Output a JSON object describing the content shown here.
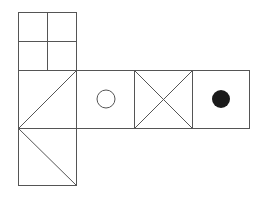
{
  "diagram": {
    "stroke_color": "#555555",
    "fill_color": "#1a1a1a",
    "faces": [
      {
        "id": "top",
        "mark": "2x2 grid"
      },
      {
        "id": "left",
        "mark": "diagonal triangle (lines from top-right and bottom-right to left-middle)"
      },
      {
        "id": "middle",
        "mark": "hollow circle"
      },
      {
        "id": "cross",
        "mark": "X (both diagonals)"
      },
      {
        "id": "right",
        "mark": "filled circle"
      },
      {
        "id": "bottom",
        "mark": "diagonal from left-top to right-bottom"
      }
    ]
  }
}
